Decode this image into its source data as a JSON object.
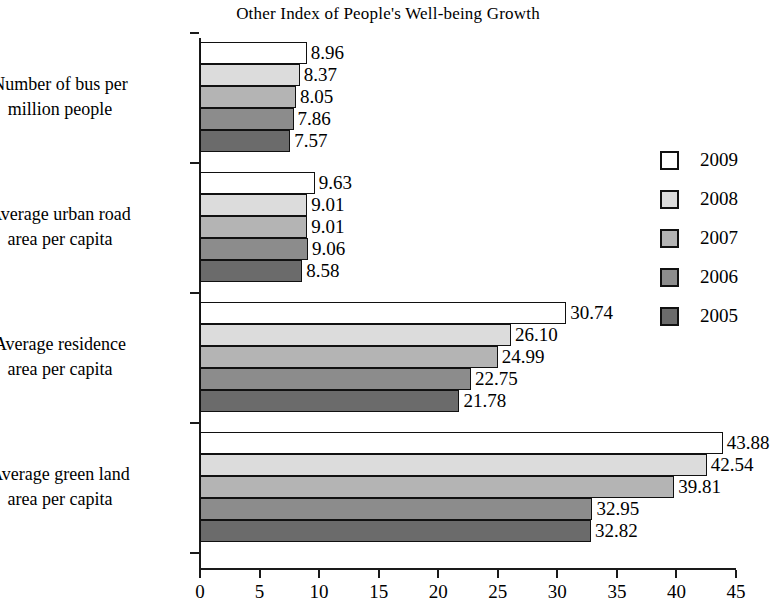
{
  "chart_data": {
    "type": "bar",
    "orientation": "horizontal",
    "title": "Other Index of People's Well-being Growth",
    "xlabel": "",
    "ylabel": "",
    "xlim": [
      0,
      45
    ],
    "xticks": [
      0,
      5,
      10,
      15,
      20,
      25,
      30,
      35,
      40,
      45
    ],
    "xtick_labels": [
      "0",
      "5",
      "10",
      "15",
      "20",
      "25",
      "30",
      "35",
      "40",
      "45"
    ],
    "grid": false,
    "legend_position": "right",
    "categories": [
      "Number of bus per million people",
      "Average urban road area per capita",
      "Average residence area per capita",
      "Average green land area per capita"
    ],
    "category_lines": [
      [
        "Number of bus per",
        "million people"
      ],
      [
        "Average urban road",
        "area per capita"
      ],
      [
        "Average residence",
        "area per capita"
      ],
      [
        "Average green land",
        "area per capita"
      ]
    ],
    "series": [
      {
        "name": "2009",
        "color": "#ffffff",
        "values": [
          8.96,
          9.63,
          30.74,
          43.88
        ],
        "labels": [
          "8.96",
          "9.63",
          "30.74",
          "43.88"
        ]
      },
      {
        "name": "2008",
        "color": "#dcdcdc",
        "values": [
          8.37,
          9.01,
          26.1,
          42.54
        ],
        "labels": [
          "8.37",
          "9.01",
          "26.10",
          "42.54"
        ]
      },
      {
        "name": "2007",
        "color": "#b4b4b4",
        "values": [
          8.05,
          9.01,
          24.99,
          39.81
        ],
        "labels": [
          "8.05",
          "9.01",
          "24.99",
          "39.81"
        ]
      },
      {
        "name": "2006",
        "color": "#8c8c8c",
        "values": [
          7.86,
          9.06,
          22.75,
          32.95
        ],
        "labels": [
          "7.86",
          "9.06",
          "22.75",
          "32.95"
        ]
      },
      {
        "name": "2005",
        "color": "#6b6b6b",
        "values": [
          7.57,
          8.58,
          21.78,
          32.82
        ],
        "labels": [
          "7.57",
          "8.58",
          "21.78",
          "32.82"
        ]
      }
    ]
  },
  "legend": {
    "entries": [
      {
        "label": "2009",
        "color": "#ffffff"
      },
      {
        "label": "2008",
        "color": "#dcdcdc"
      },
      {
        "label": "2007",
        "color": "#b4b4b4"
      },
      {
        "label": "2006",
        "color": "#8c8c8c"
      },
      {
        "label": "2005",
        "color": "#6b6b6b"
      }
    ]
  }
}
